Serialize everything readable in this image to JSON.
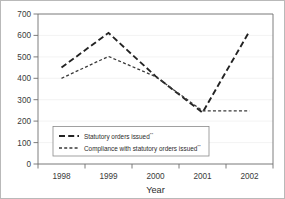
{
  "chart_data": {
    "type": "line",
    "title": "",
    "xlabel": "Year",
    "ylabel": "",
    "categories": [
      "1998",
      "1999",
      "2000",
      "2001",
      "2002"
    ],
    "x": [
      1998,
      1999,
      2000,
      2001,
      2002
    ],
    "series": [
      {
        "name": "Statutory orders issued**",
        "name_base": "Statutory orders issued",
        "name_sup": "**",
        "style": "long-dash",
        "values": [
          450,
          612,
          410,
          240,
          620
        ]
      },
      {
        "name": "Compliance with statutory orders issued**",
        "name_base": "Compliance with statutory orders issued",
        "name_sup": "**",
        "style": "short-dash",
        "values": [
          400,
          502,
          408,
          248,
          248
        ]
      }
    ],
    "ylim": [
      0,
      700
    ],
    "yticks": [
      0,
      100,
      200,
      300,
      400,
      500,
      600,
      700
    ],
    "ytick_labels": [
      "0",
      "100",
      "200",
      "300",
      "400",
      "500",
      "600",
      "700"
    ],
    "xtick_labels": [
      "1998",
      "1999",
      "2000",
      "2001",
      "2002"
    ],
    "grid": true,
    "grid_axis": "y",
    "legend_position": "lower-left-inside",
    "colors": {
      "series_primary": "#232323",
      "series_secondary": "#3a3a3a",
      "axis": "#6f6f6f",
      "grid": "#eeeeee",
      "text": "#2b2b2b",
      "border": "#b9b9b9"
    }
  }
}
